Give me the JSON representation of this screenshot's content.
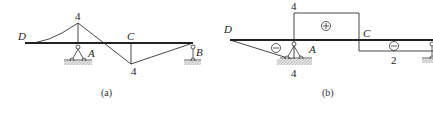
{
  "figures": [
    {
      "id": "a",
      "caption": "(a)",
      "labels": {
        "D": "D",
        "A": "A",
        "C": "C",
        "B": "B",
        "peak_value": "4",
        "valley_value": "4"
      }
    },
    {
      "id": "b",
      "caption": "(b)",
      "labels": {
        "D": "D",
        "A": "A",
        "C": "C",
        "top_value": "4",
        "bottom_value_A": "4",
        "bottom_value_C": "2",
        "plus_sign": "+",
        "minus_sign_left": "−",
        "minus_sign_right": "−"
      }
    }
  ],
  "colors": {
    "line": "#333333",
    "beam": "#222222",
    "ground_hatch": "#bbbbbb"
  }
}
